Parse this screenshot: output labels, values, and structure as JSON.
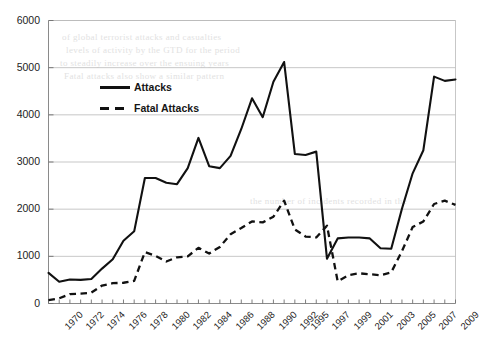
{
  "chart_data": {
    "type": "line",
    "title": "",
    "subtitle": "",
    "xlabel": "",
    "ylabel": "",
    "ylim": [
      0,
      6000
    ],
    "ytick_labels": [
      "0",
      "1000",
      "2000",
      "3000",
      "4000",
      "5000",
      "6000"
    ],
    "yticks": [
      0,
      1000,
      2000,
      3000,
      4000,
      5000,
      6000
    ],
    "grid": "horizontal",
    "legend_position": "upper-left-inside",
    "x_tick_labels": [
      "1970",
      "1972",
      "1974",
      "1976",
      "1978",
      "1980",
      "1982",
      "1984",
      "1986",
      "1988",
      "1990",
      "1992",
      "1995",
      "1997",
      "1999",
      "2001",
      "2003",
      "2005",
      "2007",
      "2009"
    ],
    "x": [
      "1970",
      "1971",
      "1972",
      "1973",
      "1974",
      "1975",
      "1976",
      "1977",
      "1978",
      "1979",
      "1980",
      "1981",
      "1982",
      "1983",
      "1984",
      "1985",
      "1986",
      "1987",
      "1988",
      "1989",
      "1990",
      "1991",
      "1992",
      "1995",
      "1996",
      "1997",
      "1998",
      "1999",
      "2000",
      "2001",
      "2002",
      "2003",
      "2004",
      "2005",
      "2006",
      "2007",
      "2008",
      "2009",
      "2010"
    ],
    "series": [
      {
        "name": "Attacks",
        "style": "solid",
        "color": "#111111",
        "values": [
          650,
          460,
          510,
          500,
          520,
          740,
          940,
          1330,
          1530,
          2660,
          2660,
          2560,
          2530,
          2870,
          3510,
          2910,
          2870,
          3130,
          3700,
          4350,
          3950,
          4700,
          5120,
          3170,
          3150,
          3220,
          950,
          1380,
          1400,
          1400,
          1380,
          1170,
          1160,
          2010,
          2760,
          3250,
          4810,
          4720,
          4750
        ]
      },
      {
        "name": "Fatal Attacks",
        "style": "dashed",
        "color": "#111111",
        "values": [
          70,
          110,
          200,
          210,
          230,
          380,
          430,
          440,
          480,
          1090,
          1010,
          890,
          980,
          1000,
          1180,
          1060,
          1200,
          1470,
          1600,
          1740,
          1720,
          1840,
          2180,
          1570,
          1420,
          1400,
          1650,
          470,
          600,
          640,
          620,
          600,
          660,
          1110,
          1620,
          1740,
          2110,
          2180,
          2090
        ]
      }
    ],
    "legend": [
      {
        "label": "Attacks",
        "style": "solid"
      },
      {
        "label": "Fatal Attacks",
        "style": "dashed"
      }
    ]
  },
  "background_bleed": [
    "of global terrorist attacks and casualties",
    "levels of activity by the GTD for the period",
    "to steadily increase over the ensuing years",
    "Fatal attacks also show a similar pattern",
    "the number of incidents recorded in the"
  ]
}
